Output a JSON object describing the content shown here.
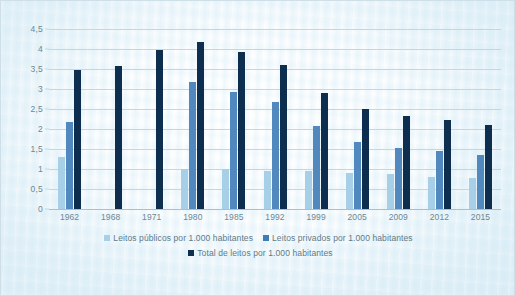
{
  "chart_data": {
    "type": "bar",
    "title": "",
    "subtitle": "",
    "xlabel": "",
    "ylabel": "",
    "ylim": [
      0,
      4.5
    ],
    "ytick_labels": [
      "4,5",
      "4",
      "3,5",
      "3",
      "2,5",
      "2",
      "1,5",
      "1",
      "0,5",
      "0"
    ],
    "ytick_values": [
      4.5,
      4,
      3.5,
      3,
      2.5,
      2,
      1.5,
      1,
      0.5,
      0
    ],
    "grid": true,
    "legend_position": "bottom",
    "categories": [
      "1962",
      "1968",
      "1971",
      "1980",
      "1985",
      "1992",
      "1999",
      "2005",
      "2009",
      "2012",
      "2015"
    ],
    "series": [
      {
        "name": "Leitos públicos por 1.000 habitantes",
        "color": "#a8cfe8",
        "values": [
          1.3,
          null,
          null,
          1.0,
          1.0,
          0.95,
          0.95,
          0.9,
          0.88,
          0.8,
          0.78
        ]
      },
      {
        "name": "Leitos privados por 1.000 habitantes",
        "color": "#3f7db5",
        "values": [
          2.17,
          null,
          null,
          3.18,
          2.92,
          2.68,
          2.08,
          1.68,
          1.52,
          1.45,
          1.35
        ]
      },
      {
        "name": "Total de leitos por 1.000 habitantes",
        "color": "#0d2e4e",
        "values": [
          3.47,
          3.58,
          3.98,
          4.18,
          3.93,
          3.6,
          2.9,
          2.5,
          2.32,
          2.22,
          2.1
        ]
      }
    ]
  },
  "legend": {
    "items": [
      {
        "label": "Leitos públicos por 1.000 habitantes",
        "swatch": "s0"
      },
      {
        "label": "Leitos privados por 1.000 habitantes",
        "swatch": "s1"
      },
      {
        "label": "Total de leitos por 1.000 habitantes",
        "swatch": "s2"
      }
    ]
  },
  "colors": {
    "series_public": "#a8cfe8",
    "series_private": "#3f7db5",
    "series_total": "#0d2e4e",
    "gridline": "#bcd9e8",
    "axis_text": "#6d8794",
    "background": "#eaf5fb"
  }
}
